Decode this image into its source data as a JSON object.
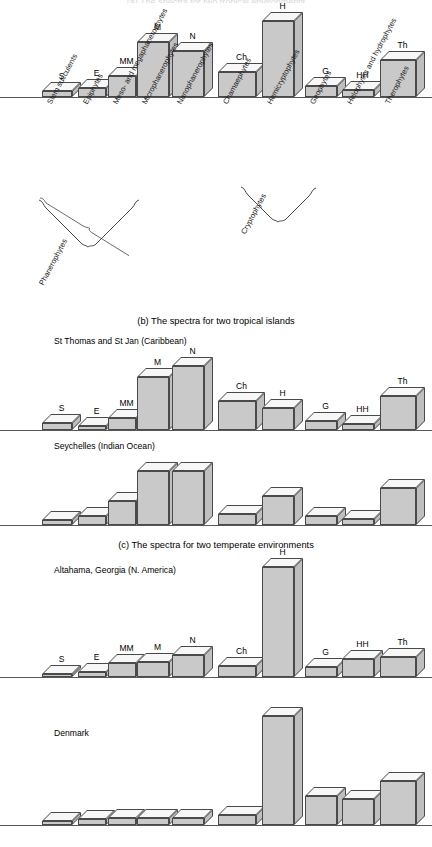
{
  "figure": {
    "top_cut_title": "(a) The spectra for two tropical environments",
    "captions": {
      "b": "(b) The spectra for two tropical islands",
      "c": "(c) The spectra for two temperate environments"
    },
    "subtitles": {
      "st_thomas": "St Thomas and St Jan (Caribbean)",
      "seychelles": "Seychelles (Indian Ocean)",
      "altahama": "Altahama, Georgia (N. America)",
      "denmark": "Denmark"
    },
    "axis_categories": [
      "Stem succulents",
      "Epiphytes",
      "Meso- and megaphanerophytes",
      "Microphanerophytes",
      "Nanophanerophytes",
      "Chamaephytes",
      "Hemicryptophytes",
      "Geophytes",
      "Helophytes and hydrophytes",
      "Therophytes"
    ],
    "bracket_groups": [
      {
        "label": "Phanerophytes"
      },
      {
        "label": "Cryptophytes"
      }
    ],
    "bar_codes": [
      "S",
      "E",
      "MM",
      "M",
      "N",
      "Ch",
      "H",
      "G",
      "HH",
      "Th"
    ],
    "colors": {
      "bar_front": "#c9c9c9",
      "bar_top": "#f7f7f7",
      "bar_side": "#bfbfbf",
      "outline": "#4a4a4a",
      "baseline": "#585858",
      "text": "#000000"
    }
  },
  "chart_data": [
    {
      "type": "bar",
      "title": "Normal / reference spectrum",
      "panel": "a",
      "show_bar_codes": true,
      "show_axis_labels": true,
      "categories": [
        "S",
        "E",
        "MM",
        "M",
        "N",
        "Ch",
        "H",
        "G",
        "HH",
        "Th"
      ],
      "category_names": [
        "Stem succulents",
        "Epiphytes",
        "Meso- and megaphanerophytes",
        "Microphanerophytes",
        "Nanophanerophytes",
        "Chamaephytes",
        "Hemicryptophytes",
        "Geophytes",
        "Helophytes and hydrophytes",
        "Therophytes"
      ],
      "values": [
        5,
        8,
        19,
        49,
        41,
        22,
        68,
        10,
        6,
        33
      ],
      "ylabel": "",
      "xlabel": "",
      "grid": false,
      "legend": "none"
    },
    {
      "type": "bar",
      "title": "St Thomas and St Jan (Caribbean)",
      "panel": "b1",
      "show_bar_codes": true,
      "show_axis_labels": false,
      "categories": [
        "S",
        "E",
        "MM",
        "M",
        "N",
        "Ch",
        "H",
        "G",
        "HH",
        "Th"
      ],
      "values": [
        6,
        4,
        11,
        47,
        57,
        26,
        20,
        8,
        5,
        30
      ],
      "ylabel": "",
      "xlabel": "",
      "grid": false,
      "legend": "none"
    },
    {
      "type": "bar",
      "title": "Seychelles (Indian Ocean)",
      "panel": "b2",
      "show_bar_codes": false,
      "show_axis_labels": false,
      "categories": [
        "S",
        "E",
        "MM",
        "M",
        "N",
        "Ch",
        "H",
        "G",
        "HH",
        "Th"
      ],
      "values": [
        4,
        7,
        20,
        44,
        44,
        9,
        24,
        7,
        5,
        30
      ],
      "ylabel": "",
      "xlabel": "",
      "grid": false,
      "legend": "none"
    },
    {
      "type": "bar",
      "title": "Altahama, Georgia (N. America)",
      "panel": "c1",
      "show_bar_codes": true,
      "show_axis_labels": false,
      "categories": [
        "S",
        "E",
        "MM",
        "M",
        "N",
        "Ch",
        "H",
        "G",
        "HH",
        "Th"
      ],
      "values": [
        3,
        5,
        13,
        14,
        21,
        10,
        103,
        9,
        17,
        19
      ],
      "ylabel": "",
      "xlabel": "",
      "grid": false,
      "legend": "none"
    },
    {
      "type": "bar",
      "title": "Denmark",
      "panel": "c2",
      "show_bar_codes": false,
      "show_axis_labels": false,
      "categories": [
        "S",
        "E",
        "MM",
        "M",
        "N",
        "Ch",
        "H",
        "G",
        "HH",
        "Th"
      ],
      "values": [
        3,
        5,
        6,
        6,
        6,
        8,
        91,
        24,
        22,
        37
      ],
      "ylabel": "",
      "xlabel": "",
      "grid": false,
      "legend": "none"
    }
  ]
}
